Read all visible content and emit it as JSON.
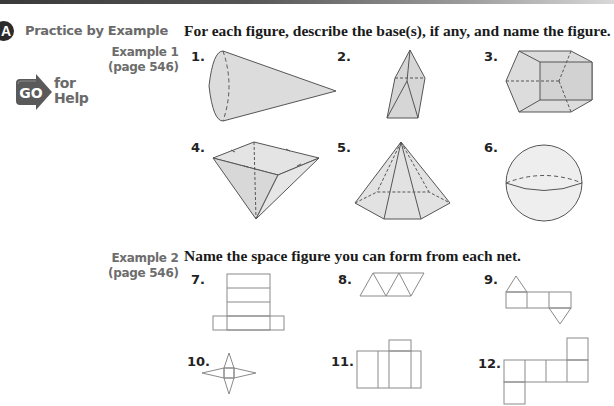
{
  "section": {
    "badge": "A",
    "title": "Practice by Example"
  },
  "go_for_help": {
    "go": "GO",
    "line1": "for",
    "line2": "Help"
  },
  "example1": {
    "label": "Example 1",
    "page": "(page 546)",
    "instruction": "For each figure, describe the base(s), if any, and name the figure.",
    "items": [
      {
        "number": "1.",
        "figure": "cone"
      },
      {
        "number": "2.",
        "figure": "triangular-pyramid"
      },
      {
        "number": "3.",
        "figure": "pentagonal-prism"
      },
      {
        "number": "4.",
        "figure": "square-pyramid-inverted"
      },
      {
        "number": "5.",
        "figure": "hexagonal-pyramid"
      },
      {
        "number": "6.",
        "figure": "sphere"
      }
    ]
  },
  "example2": {
    "label": "Example 2",
    "page": "(page 546)",
    "instruction": "Name the space figure you can form from each net.",
    "items": [
      {
        "number": "7.",
        "figure": "net-rectangular-prism"
      },
      {
        "number": "8.",
        "figure": "net-triangles-strip"
      },
      {
        "number": "9.",
        "figure": "net-triangular-prism"
      },
      {
        "number": "10.",
        "figure": "net-star-pyramid"
      },
      {
        "number": "11.",
        "figure": "net-rectangles"
      },
      {
        "number": "12.",
        "figure": "net-cube"
      }
    ]
  },
  "colors": {
    "figure_fill": "#dcdcdc",
    "figure_stroke": "#555555",
    "net_stroke": "#8a8a8a",
    "label_gray": "#6a6a6a"
  }
}
